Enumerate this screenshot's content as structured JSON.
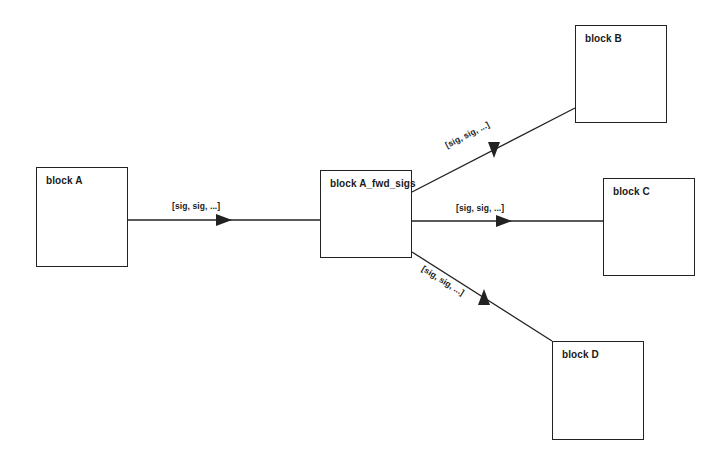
{
  "diagram": {
    "background_color": "#ffffff",
    "stroke_color": "#222222",
    "text_color": "#1a1a1a",
    "blocks": [
      {
        "id": "block-a",
        "label": "block A",
        "x": 36,
        "y": 167,
        "w": 92,
        "h": 100
      },
      {
        "id": "block-a-fwd-sigs",
        "label": "block A_fwd_sigs",
        "x": 320,
        "y": 170,
        "w": 92,
        "h": 88
      },
      {
        "id": "block-b",
        "label": "block B",
        "x": 575,
        "y": 25,
        "w": 92,
        "h": 98
      },
      {
        "id": "block-c",
        "label": "block C",
        "x": 603,
        "y": 178,
        "w": 92,
        "h": 98
      },
      {
        "id": "block-d",
        "label": "block D",
        "x": 552,
        "y": 341,
        "w": 92,
        "h": 99
      }
    ],
    "edges": [
      {
        "id": "edge-a-to-fwd",
        "from": "block A",
        "to": "block A_fwd_sigs",
        "label": "[sig, sig, ...]",
        "x1": 128,
        "y1": 220,
        "x2": 320,
        "y2": 220,
        "arrow_x": 224,
        "arrow_y": 220,
        "arrow_angle": 0,
        "label_x": 172,
        "label_y": 201,
        "label_angle": 0
      },
      {
        "id": "edge-fwd-to-b",
        "from": "block A_fwd_sigs",
        "to": "block B",
        "label": "[sig, sig, ...]",
        "x1": 412,
        "y1": 192,
        "x2": 575,
        "y2": 108,
        "arrow_x": 494,
        "arrow_y": 150,
        "arrow_angle": 90,
        "label_x": 448,
        "label_y": 140,
        "label_angle": -27
      },
      {
        "id": "edge-fwd-to-c",
        "from": "block A_fwd_sigs",
        "to": "block C",
        "label": "[sig, sig, ...]",
        "x1": 412,
        "y1": 221,
        "x2": 603,
        "y2": 221,
        "arrow_x": 504,
        "arrow_y": 221,
        "arrow_angle": 0,
        "label_x": 456,
        "label_y": 203,
        "label_angle": 0
      },
      {
        "id": "edge-fwd-to-d",
        "from": "block A_fwd_sigs",
        "to": "block D",
        "label": "[sig, sig, ...]",
        "x1": 412,
        "y1": 252,
        "x2": 552,
        "y2": 341,
        "arrow_x": 484,
        "arrow_y": 297,
        "arrow_angle": -90,
        "label_x": 420,
        "label_y": 262,
        "label_angle": 32
      }
    ]
  }
}
